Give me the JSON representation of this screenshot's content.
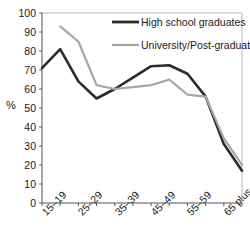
{
  "chart_data": {
    "type": "line",
    "title": "",
    "xlabel": "",
    "ylabel": "%",
    "ylim": [
      0,
      100
    ],
    "ytick_step": 10,
    "yticks": [
      "0",
      "10",
      "20",
      "30",
      "40",
      "50",
      "60",
      "70",
      "80",
      "90",
      "100"
    ],
    "grid": false,
    "legend_position": "top-right-inside",
    "categories": [
      "15–19",
      "20–24",
      "25–29",
      "30–34",
      "35–39",
      "40–44",
      "45–49",
      "50–54",
      "55–59",
      "60–64",
      "65 plus",
      ""
    ],
    "xtick_labels_shown": [
      "15–19",
      "25–29",
      "35–39",
      "45–49",
      "55–59",
      "65 plus"
    ],
    "series": [
      {
        "name": "High school graduates",
        "color": "#2b2b2b",
        "width": 2.6,
        "values": [
          71,
          81,
          64,
          55,
          60,
          66,
          72,
          72.5,
          68,
          56,
          31,
          17
        ]
      },
      {
        "name": "University/Post-graduates",
        "color": "#a6a6a6",
        "width": 2.2,
        "values": [
          null,
          93,
          85,
          62,
          60,
          61,
          62,
          65,
          57,
          56,
          34,
          20
        ]
      }
    ]
  },
  "legend": {
    "items": [
      {
        "label": "High school graduates",
        "color": "#2b2b2b"
      },
      {
        "label": "University/Post-graduates",
        "color": "#a6a6a6"
      }
    ]
  },
  "axis": {
    "y_title": "%"
  }
}
